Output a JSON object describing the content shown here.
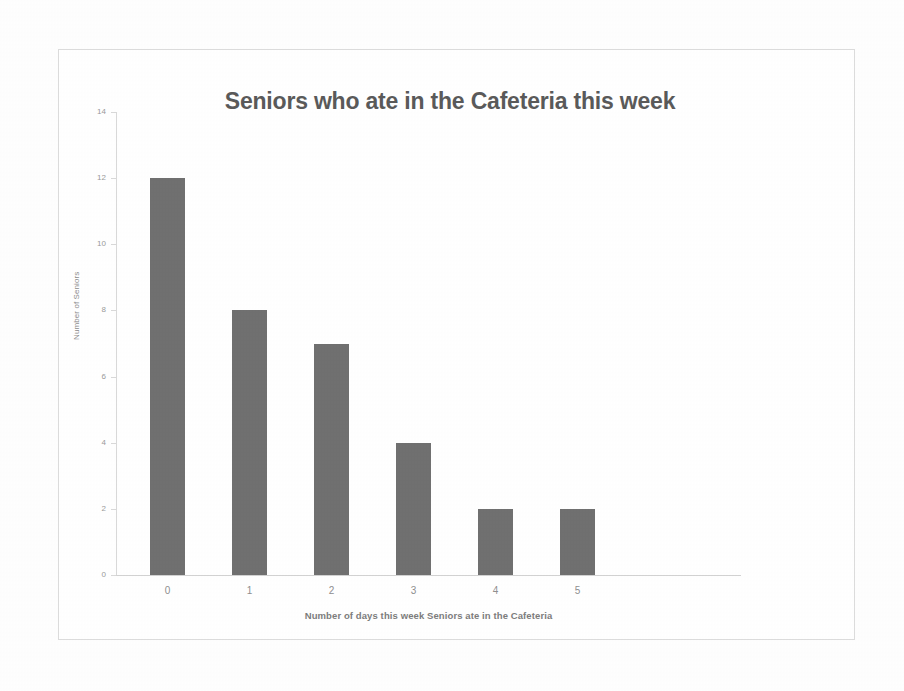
{
  "chart_data": {
    "type": "bar",
    "title": "Seniors who ate in the Cafeteria this week",
    "xlabel": "Number of days this week Seniors ate in the Cafeteria",
    "ylabel": "Number of Seniors",
    "categories": [
      "0",
      "1",
      "2",
      "3",
      "4",
      "5"
    ],
    "values": [
      12,
      8,
      7,
      4,
      2,
      2
    ],
    "series": [
      {
        "name": "Number of Seniors",
        "values": [
          12,
          8,
          7,
          4,
          2,
          2
        ]
      }
    ],
    "ylim": [
      0,
      14
    ],
    "y_ticks": [
      "0",
      "2",
      "4",
      "6",
      "8",
      "10",
      "12",
      "14"
    ],
    "y_tick_values": [
      0,
      2,
      4,
      6,
      8,
      10,
      12,
      14
    ],
    "grid": false,
    "legend": "none",
    "bar_color": "#707070",
    "title_color": "#5a5a5a",
    "axis_color": "#d9d9d9",
    "tick_label_color": "#9a9a9a"
  }
}
